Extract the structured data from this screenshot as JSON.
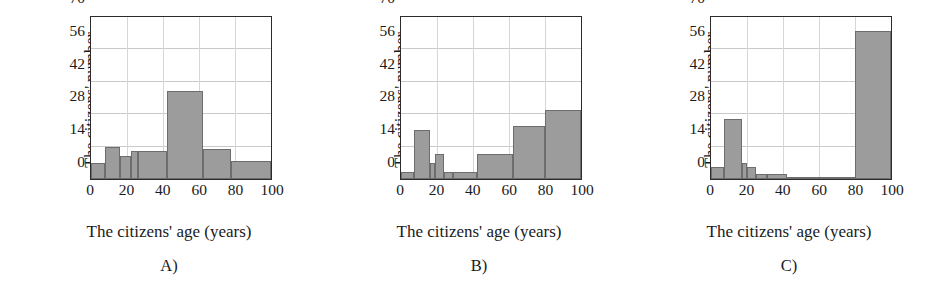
{
  "figure": {
    "panel_width": 310,
    "axis_titles": {
      "x": "The citizens' age (years)",
      "y_line1": "The citizens' number",
      "y_line2": "in the given age range"
    }
  },
  "chart_data": [
    {
      "type": "bar",
      "title": "",
      "caption": "A)",
      "xlabel": "The citizens' age (years)",
      "ylabel": "The citizens' number in the given age range",
      "xlim": [
        0,
        100
      ],
      "ylim": [
        0,
        70
      ],
      "xticks": [
        0,
        20,
        40,
        60,
        80,
        100
      ],
      "yticks": [
        0,
        14,
        28,
        42,
        56,
        70
      ],
      "grid": true,
      "bin_edges": [
        0,
        8,
        16,
        22,
        26,
        42,
        62,
        78,
        100
      ],
      "values": [
        7,
        14,
        10,
        12,
        12,
        38,
        13,
        8
      ],
      "bars": [
        {
          "x0": 0,
          "x1": 8,
          "height": 7
        },
        {
          "x0": 8,
          "x1": 16,
          "height": 14
        },
        {
          "x0": 16,
          "x1": 22,
          "height": 10
        },
        {
          "x0": 22,
          "x1": 26,
          "height": 12
        },
        {
          "x0": 26,
          "x1": 42,
          "height": 12
        },
        {
          "x0": 42,
          "x1": 62,
          "height": 38
        },
        {
          "x0": 62,
          "x1": 78,
          "height": 13
        },
        {
          "x0": 78,
          "x1": 100,
          "height": 8
        }
      ]
    },
    {
      "type": "bar",
      "title": "",
      "caption": "B)",
      "xlabel": "The citizens' age (years)",
      "ylabel": "The citizens' number in the given age range",
      "xlim": [
        0,
        100
      ],
      "ylim": [
        0,
        70
      ],
      "xticks": [
        0,
        20,
        40,
        60,
        80,
        100
      ],
      "yticks": [
        0,
        14,
        28,
        42,
        56,
        70
      ],
      "grid": true,
      "bin_edges": [
        0,
        7,
        16,
        19,
        24,
        29,
        42,
        62,
        80,
        100
      ],
      "values": [
        3,
        21,
        7,
        11,
        3,
        3,
        11,
        23,
        30
      ],
      "bars": [
        {
          "x0": 0,
          "x1": 7,
          "height": 3
        },
        {
          "x0": 7,
          "x1": 16,
          "height": 21
        },
        {
          "x0": 16,
          "x1": 19,
          "height": 7
        },
        {
          "x0": 19,
          "x1": 24,
          "height": 11
        },
        {
          "x0": 24,
          "x1": 29,
          "height": 3
        },
        {
          "x0": 29,
          "x1": 42,
          "height": 3
        },
        {
          "x0": 42,
          "x1": 62,
          "height": 11
        },
        {
          "x0": 62,
          "x1": 80,
          "height": 23
        },
        {
          "x0": 80,
          "x1": 100,
          "height": 30
        }
      ]
    },
    {
      "type": "bar",
      "title": "",
      "caption": "C)",
      "xlabel": "The citizens' age (years)",
      "ylabel": "The citizens' number in the given age range",
      "xlim": [
        0,
        100
      ],
      "ylim": [
        0,
        70
      ],
      "xticks": [
        0,
        20,
        40,
        60,
        80,
        100
      ],
      "yticks": [
        0,
        14,
        28,
        42,
        56,
        70
      ],
      "grid": true,
      "bin_edges": [
        0,
        7,
        17,
        20,
        25,
        31,
        42,
        60,
        80,
        100
      ],
      "values": [
        5,
        26,
        7,
        5,
        2,
        2,
        1,
        1,
        64
      ],
      "bars": [
        {
          "x0": 0,
          "x1": 7,
          "height": 5
        },
        {
          "x0": 7,
          "x1": 17,
          "height": 26
        },
        {
          "x0": 17,
          "x1": 20,
          "height": 7
        },
        {
          "x0": 20,
          "x1": 25,
          "height": 5
        },
        {
          "x0": 25,
          "x1": 31,
          "height": 2
        },
        {
          "x0": 31,
          "x1": 42,
          "height": 2
        },
        {
          "x0": 42,
          "x1": 60,
          "height": 1
        },
        {
          "x0": 60,
          "x1": 80,
          "height": 1
        },
        {
          "x0": 80,
          "x1": 100,
          "height": 64
        }
      ]
    }
  ],
  "colors": {
    "bar_fill": "#9c9c9c",
    "bar_stroke": "#6d6d6d",
    "axis": "#2b2b2b",
    "grid": "#c9c9c9",
    "background": "#ffffff"
  }
}
